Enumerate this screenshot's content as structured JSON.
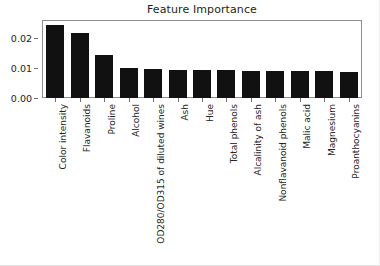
{
  "chart_data": {
    "type": "bar",
    "title": "Feature Importance",
    "xlabel": "",
    "ylabel": "",
    "grid": false,
    "legend": null,
    "ylim": [
      0.0,
      0.0257
    ],
    "yticks": [
      "0.00",
      "0.01",
      "0.02"
    ],
    "ytick_values": [
      0.0,
      0.01,
      0.02
    ],
    "orientation": "vertical",
    "bar_color": "#111111",
    "categories": [
      "Color intensity",
      "Flavanoids",
      "Proline",
      "Alcohol",
      "OD280/OD315 of diluted wines",
      "Ash",
      "Hue",
      "Total phenols",
      "Alcalinity of ash",
      "Nonflavanoid phenols",
      "Malic acid",
      "Magnesium",
      "Proanthocyanins"
    ],
    "values": [
      0.0243,
      0.0216,
      0.0145,
      0.01,
      0.0097,
      0.0095,
      0.0093,
      0.0092,
      0.0091,
      0.0091,
      0.009,
      0.0089,
      0.0088
    ]
  }
}
